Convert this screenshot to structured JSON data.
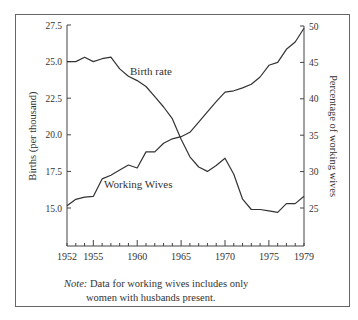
{
  "chart_data": {
    "type": "line",
    "title": "",
    "xlabel": "",
    "ylabel": "Births (per thousand)",
    "ylabel_right": "Percentage of working wives",
    "x": [
      1952,
      1953,
      1954,
      1955,
      1956,
      1957,
      1958,
      1959,
      1960,
      1961,
      1962,
      1963,
      1964,
      1965,
      1966,
      1967,
      1968,
      1969,
      1970,
      1971,
      1972,
      1973,
      1974,
      1975,
      1976,
      1977,
      1978,
      1979
    ],
    "xticks_labeled": [
      1952,
      1955,
      1960,
      1965,
      1970,
      1975,
      1979
    ],
    "ylim": [
      13.0,
      27.5
    ],
    "yticks": [
      15.0,
      17.5,
      20.0,
      22.5,
      25.0,
      27.5
    ],
    "ylim_right": [
      21,
      50
    ],
    "yticks_right": [
      25,
      30,
      35,
      40,
      45,
      50
    ],
    "grid": false,
    "legend": "inline labels",
    "series": [
      {
        "name": "Birth rate",
        "axis": "left",
        "values": [
          25.0,
          25.0,
          25.3,
          25.0,
          25.2,
          25.3,
          24.5,
          24.0,
          23.7,
          23.3,
          22.6,
          21.9,
          21.1,
          19.7,
          18.5,
          17.8,
          17.5,
          17.9,
          18.4,
          17.3,
          15.6,
          14.9,
          14.9,
          14.8,
          14.7,
          15.3,
          15.3,
          15.8
        ]
      },
      {
        "name": "Working Wives",
        "axis": "right",
        "values": [
          25.3,
          26.2,
          26.5,
          26.6,
          29.0,
          29.5,
          30.2,
          30.9,
          30.5,
          32.7,
          32.7,
          33.9,
          34.5,
          34.8,
          35.4,
          36.8,
          38.2,
          39.6,
          40.9,
          41.1,
          41.5,
          42.0,
          43.0,
          44.6,
          45.0,
          46.8,
          47.8,
          49.7
        ]
      }
    ],
    "annotations": [
      "Birth rate",
      "Working Wives"
    ]
  },
  "labels": {
    "birth_rate": "Birth rate",
    "working_wives": "Working Wives",
    "y_left": "Births (per thousand)",
    "y_right": "Percentage of working wives"
  },
  "note": {
    "prefix": "Note:",
    "line1": " Data for working wives includes only",
    "line2": "women with husbands present."
  }
}
